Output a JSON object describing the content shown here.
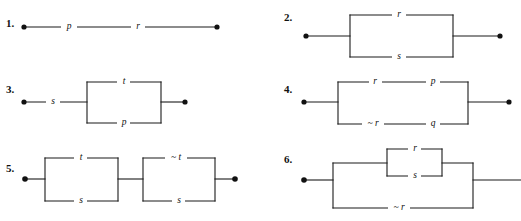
{
  "page": {
    "background": "#ffffff",
    "ink": "#1a1a1a",
    "width": 521,
    "height": 221
  },
  "problems": [
    {
      "number": "1.",
      "type": "series",
      "labels": [
        "p",
        "r"
      ],
      "terminals": 2
    },
    {
      "number": "2.",
      "type": "parallel",
      "labels": [
        "r",
        "s"
      ],
      "top_label": "r",
      "bottom_label": "s",
      "terminals": 2
    },
    {
      "number": "3.",
      "type": "series-then-parallel",
      "series_label": "s",
      "top_label": "t",
      "bottom_label": "p",
      "terminals": 2
    },
    {
      "number": "4.",
      "type": "parallel-with-series-branches",
      "top_labels": [
        "r",
        "p"
      ],
      "bottom_labels": [
        "~ r",
        "q"
      ],
      "terminals": 2
    },
    {
      "number": "5.",
      "type": "two-parallel-blocks-in-series",
      "block1_top": "t",
      "block1_bottom": "s",
      "block2_top": "~ t",
      "block2_bottom": "s",
      "terminals": 2
    },
    {
      "number": "6.",
      "type": "nested-parallel",
      "inner_top": "r",
      "inner_bottom": "s",
      "outer_bottom": "~ r",
      "terminals": 2
    }
  ]
}
